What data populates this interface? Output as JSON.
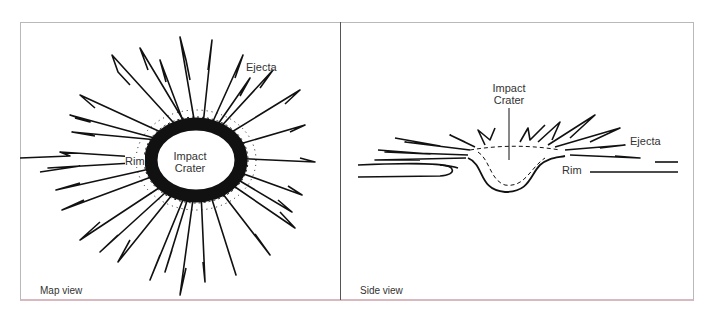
{
  "diagram": {
    "panels": [
      {
        "id": "map-view",
        "caption": "Map view",
        "labels": {
          "ejecta": "Ejecta",
          "rim": "Rim",
          "crater_line1": "Impact",
          "crater_line2": "Crater"
        }
      },
      {
        "id": "side-view",
        "caption": "Side view",
        "labels": {
          "crater_line1": "Impact",
          "crater_line2": "Crater",
          "ejecta": "Ejecta",
          "rim": "Rim"
        }
      }
    ],
    "colors": {
      "frame": "#b9b9b9",
      "ink": "#111111",
      "text": "#333333"
    }
  }
}
